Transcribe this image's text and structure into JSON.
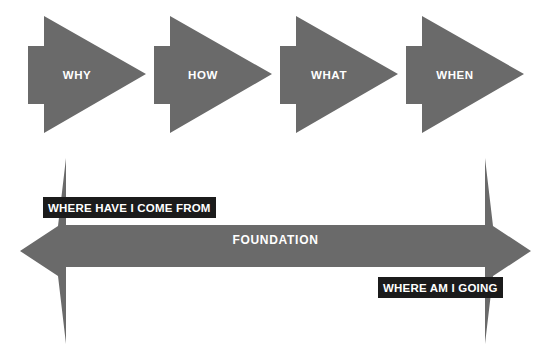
{
  "diagram": {
    "title_text": "",
    "background_color": "#ffffff",
    "shape_fill": "#6a6a6a",
    "callout_background": "#1b1b1b",
    "callout_text_color": "#ffffff",
    "shape_text_color": "#ffffff"
  },
  "arrows": [
    {
      "label": "WHY",
      "x": 28,
      "order": 1
    },
    {
      "label": "HOW",
      "x": 154,
      "order": 2
    },
    {
      "label": "WHAT",
      "x": 280,
      "order": 3
    },
    {
      "label": "WHEN",
      "x": 406,
      "order": 4
    }
  ],
  "foundation": {
    "label": "FOUNDATION",
    "direction": "double-headed-horizontal"
  },
  "callouts": [
    {
      "id": "where-have-i-come-from",
      "text": "WHERE HAVE I COME FROM",
      "position": "upper-left"
    },
    {
      "id": "where-am-i-going",
      "text": "WHERE AM I GOING",
      "position": "lower-right"
    }
  ]
}
